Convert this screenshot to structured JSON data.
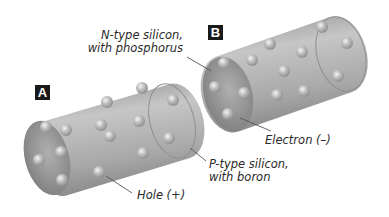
{
  "diagram": {
    "panels": [
      {
        "id": "A",
        "label": "A",
        "material": "P-type silicon, with boron",
        "carrier": "Hole (+)"
      },
      {
        "id": "B",
        "label": "B",
        "material": "N-type silicon, with phosphorus",
        "carrier": "Electron (–)"
      }
    ],
    "labels": {
      "badge_a": "A",
      "badge_b": "B",
      "n_type_line1": "N-type silicon,",
      "n_type_line2": "with phosphorus",
      "p_type_line1": "P-type silicon,",
      "p_type_line2": "with boron",
      "hole": "Hole (+)",
      "electron": "Electron (–)"
    },
    "colors": {
      "cylinder": "#9a9a9a",
      "cylinder_light": "#c4c4c4",
      "cylinder_dark": "#7d7d7d",
      "sphere": "#b8b8b8",
      "badge": "#1a1a1a",
      "leader_line": "#555555"
    }
  }
}
